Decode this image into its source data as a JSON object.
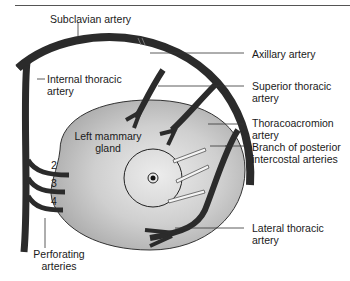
{
  "diagram": {
    "labels": {
      "subclavian": "Subclavian artery",
      "internal_thoracic_1": "Internal thoracic",
      "internal_thoracic_2": "artery",
      "axillary": "Axillary artery",
      "superior_thoracic_1": "Superior thoracic",
      "superior_thoracic_2": "artery",
      "thoracoacromion_1": "Thoracoacromion",
      "thoracoacromion_2": "artery",
      "posterior_intercostal_1": "Branch of posterior",
      "posterior_intercostal_2": "intercostal arteries",
      "lateral_thoracic_1": "Lateral thoracic",
      "lateral_thoracic_2": "artery",
      "gland_1": "Left mammary",
      "gland_2": "gland",
      "perforating_1": "Perforating",
      "perforating_2": "arteries"
    },
    "intercostal_numbers": [
      "2",
      "3",
      "4"
    ],
    "colors": {
      "artery": "#2b2b2b",
      "gland_light": "#e2e2e2",
      "gland_dark": "#a9a9a9",
      "outline": "#333333",
      "leader": "#333333"
    }
  }
}
